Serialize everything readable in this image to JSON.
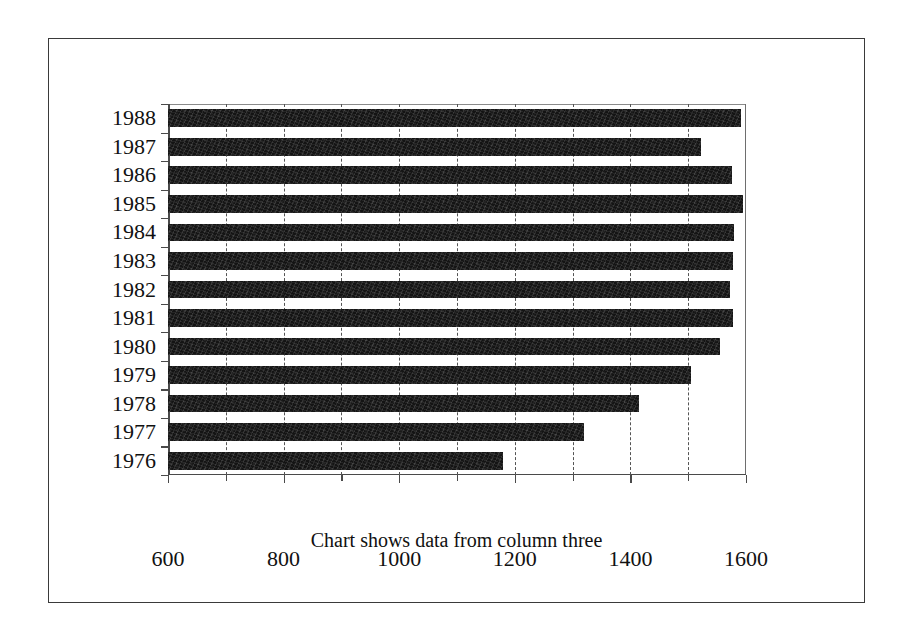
{
  "chart_data": {
    "type": "bar",
    "orientation": "horizontal",
    "title": "",
    "caption": "Chart shows data from column three",
    "xlabel": "",
    "ylabel": "",
    "categories": [
      "1988",
      "1987",
      "1986",
      "1985",
      "1984",
      "1983",
      "1982",
      "1981",
      "1980",
      "1979",
      "1978",
      "1977",
      "1976"
    ],
    "values": [
      1591,
      1522,
      1575,
      1595,
      1580,
      1578,
      1572,
      1578,
      1555,
      1505,
      1415,
      1320,
      1180
    ],
    "xlim": [
      600,
      1600
    ],
    "xticks": [
      600,
      700,
      800,
      900,
      1000,
      1100,
      1200,
      1300,
      1400,
      1500,
      1600
    ],
    "xtick_labels": [
      "600",
      "",
      "800",
      "",
      "1000",
      "",
      "1200",
      "",
      "1400",
      "",
      "1600"
    ],
    "major_xticks": [
      600,
      800,
      1000,
      1200,
      1400,
      1600
    ],
    "gridlines": [
      700,
      800,
      900,
      1000,
      1100,
      1200,
      1300,
      1400,
      1500
    ],
    "grid": true,
    "legend": null,
    "bar_color": "#141414",
    "axis_color": "#4a4a4a",
    "background": "#ffffff",
    "frame_color": "#3a3a3a"
  }
}
